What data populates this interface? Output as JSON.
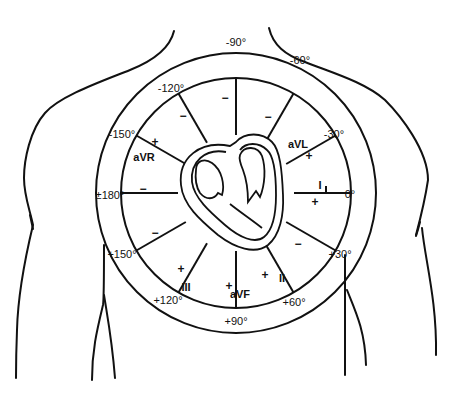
{
  "diagram": {
    "colors": {
      "stroke": "#111111",
      "background": "#ffffff"
    },
    "angle_labels": [
      {
        "text": "-90°",
        "x": 236,
        "y": 46
      },
      {
        "text": "-60°",
        "x": 300,
        "y": 64
      },
      {
        "text": "-30°",
        "x": 334,
        "y": 138
      },
      {
        "text": "0°",
        "x": 350,
        "y": 198
      },
      {
        "text": "+30°",
        "x": 340,
        "y": 258
      },
      {
        "text": "+60°",
        "x": 294,
        "y": 306
      },
      {
        "text": "+90°",
        "x": 236,
        "y": 325
      },
      {
        "text": "+120°",
        "x": 168,
        "y": 304
      },
      {
        "text": "+150°",
        "x": 122,
        "y": 258
      },
      {
        "text": "±180°",
        "x": 110,
        "y": 199
      },
      {
        "text": "-150°",
        "x": 122,
        "y": 138
      },
      {
        "text": "-120°",
        "x": 171,
        "y": 92
      }
    ],
    "leads": [
      {
        "name": "I",
        "x": 320,
        "y": 189
      },
      {
        "name": "aVL",
        "x": 298,
        "y": 148
      },
      {
        "name": "aVR",
        "x": 144,
        "y": 161
      },
      {
        "name": "III",
        "x": 186,
        "y": 291
      },
      {
        "name": "aVF",
        "x": 240,
        "y": 298
      },
      {
        "name": "II",
        "x": 282,
        "y": 282
      }
    ],
    "signs": [
      {
        "text": "+",
        "x": 315,
        "y": 206
      },
      {
        "text": "+",
        "x": 309,
        "y": 160
      },
      {
        "text": "+",
        "x": 155,
        "y": 146
      },
      {
        "text": "+",
        "x": 181,
        "y": 273
      },
      {
        "text": "+",
        "x": 229,
        "y": 290
      },
      {
        "text": "+",
        "x": 265,
        "y": 279
      },
      {
        "text": "−",
        "x": 143,
        "y": 193
      },
      {
        "text": "−",
        "x": 155,
        "y": 237
      },
      {
        "text": "−",
        "x": 183,
        "y": 120
      },
      {
        "text": "−",
        "x": 225,
        "y": 102
      },
      {
        "text": "−",
        "x": 268,
        "y": 121
      },
      {
        "text": "−",
        "x": 298,
        "y": 248
      }
    ]
  }
}
